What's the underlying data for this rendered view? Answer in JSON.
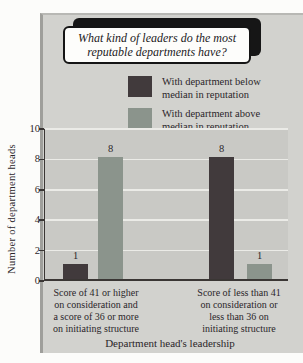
{
  "colors": {
    "panel_bg": "#d2d2ce",
    "plot_bg": "#c9c9c5",
    "gridline": "#ebebe7",
    "axis": "#3a3634",
    "series_below": "#413a3c",
    "series_above": "#8b948c",
    "text": "#2b262a",
    "title_box_bg": "#fdfdfb",
    "title_box_shadow": "#161616"
  },
  "title_box": {
    "line1": "What kind of leaders do the most",
    "line2": "reputable departments have?"
  },
  "legend": {
    "items": [
      {
        "line1": "With department below",
        "line2": "median in reputation",
        "color": "#413a3c"
      },
      {
        "line1": "With department above",
        "line2": "median in reputation",
        "color": "#8b948c"
      }
    ]
  },
  "axis": {
    "ylabel": "Number of department heads",
    "xlabel": "Department head's leadership"
  },
  "chart_data": {
    "type": "bar",
    "title": "What kind of leaders do the most reputable departments have?",
    "categories": [
      "Score of 41 or higher on consideration and a score of 36 or more on initiating structure",
      "Score of less than 41 on consideration or less than 36 on initiating structure"
    ],
    "categories_lines": [
      [
        "Score of 41 or higher",
        "on consideration and",
        "a score of 36 or more",
        "on initiating structure"
      ],
      [
        "Score of less than 41",
        "on consideration or",
        "less than 36 on",
        "initiating structure"
      ]
    ],
    "series": [
      {
        "name": "With department below median in reputation",
        "values": [
          1,
          8
        ],
        "color": "#413a3c"
      },
      {
        "name": "With department above median in reputation",
        "values": [
          8,
          1
        ],
        "color": "#8b948c"
      }
    ],
    "xlabel": "Department head's leadership",
    "ylabel": "Number of department heads",
    "ylim": [
      0,
      10
    ],
    "yticks": [
      0,
      2,
      4,
      6,
      8,
      10
    ],
    "grid": true,
    "legend_position": "top-right"
  }
}
